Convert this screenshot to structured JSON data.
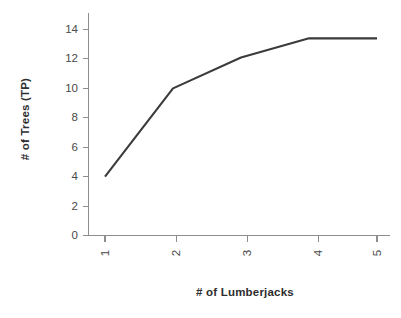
{
  "chart_data": {
    "type": "line",
    "title": "",
    "xlabel": "# of Lumberjacks",
    "ylabel": "# of Trees (TP)",
    "x": [
      1,
      2,
      3,
      4,
      5
    ],
    "values": [
      4.0,
      10.0,
      12.1,
      13.4,
      13.4
    ],
    "series": [
      {
        "name": "# of Trees (TP)",
        "values": [
          4.0,
          10.0,
          12.1,
          13.4,
          13.4
        ],
        "color": "#3b3b3b"
      }
    ],
    "xlim": [
      0.85,
      5.15
    ],
    "ylim": [
      0,
      14.8
    ],
    "x_tick_labels": [
      "1",
      "2",
      "3",
      "4",
      "5"
    ],
    "y_tick_labels": [
      "0",
      "2",
      "4",
      "6",
      "8",
      "10",
      "12",
      "14"
    ],
    "y_ticks": [
      0,
      2,
      4,
      6,
      8,
      10,
      12,
      14
    ],
    "grid": false,
    "legend": null,
    "x_tick_rotation": "90",
    "axis_color": "#8d8d8d",
    "background": "#ffffff"
  },
  "axes": {
    "y_title": "# of Trees (TP)",
    "x_title": "# of Lumberjacks",
    "y_labels": [
      "14",
      "12",
      "10",
      "8",
      "6",
      "4",
      "2",
      "0"
    ],
    "x_labels": [
      "1",
      "2",
      "3",
      "4",
      "5"
    ]
  }
}
